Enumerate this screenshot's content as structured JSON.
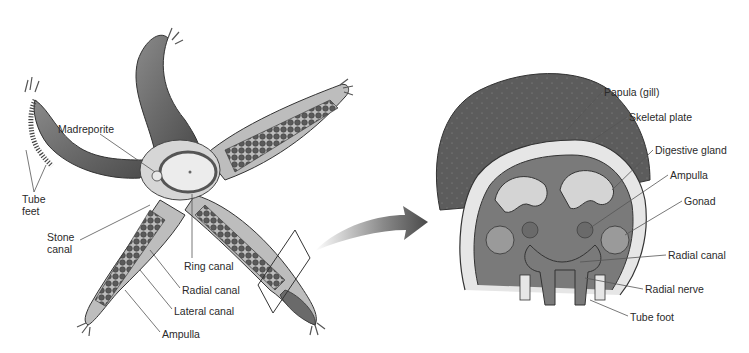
{
  "diagram": {
    "left_panel": {
      "name": "whole sea star",
      "labels": [
        {
          "id": "madreporite",
          "text": "Madreporite",
          "x": 58,
          "y": 123
        },
        {
          "id": "tube-feet",
          "text": "Tube\nfeet",
          "x": 22,
          "y": 193
        },
        {
          "id": "stone-canal",
          "text": "Stone\ncanal",
          "x": 47,
          "y": 231
        },
        {
          "id": "ring-canal",
          "text": "Ring canal",
          "x": 184,
          "y": 260
        },
        {
          "id": "radial-canal",
          "text": "Radial canal",
          "x": 182,
          "y": 284
        },
        {
          "id": "lateral-canal",
          "text": "Lateral canal",
          "x": 174,
          "y": 305
        },
        {
          "id": "ampulla",
          "text": "Ampulla",
          "x": 162,
          "y": 328
        }
      ]
    },
    "arrow": {
      "direction": "right",
      "color": "#555555"
    },
    "right_panel": {
      "name": "arm cross-section",
      "labels": [
        {
          "id": "papula",
          "text": "Papula (gill)",
          "x": 604,
          "y": 86
        },
        {
          "id": "skeletal-plate",
          "text": "Skeletal plate",
          "x": 629,
          "y": 111
        },
        {
          "id": "digestive-gland",
          "text": "Digestive gland",
          "x": 655,
          "y": 144
        },
        {
          "id": "ampulla-r",
          "text": "Ampulla",
          "x": 670,
          "y": 169
        },
        {
          "id": "gonad",
          "text": "Gonad",
          "x": 684,
          "y": 195
        },
        {
          "id": "radial-canal-r",
          "text": "Radial canal",
          "x": 668,
          "y": 249
        },
        {
          "id": "radial-nerve",
          "text": "Radial nerve",
          "x": 645,
          "y": 283
        },
        {
          "id": "tube-foot",
          "text": "Tube foot",
          "x": 630,
          "y": 311
        }
      ]
    },
    "colors": {
      "body": "#6e6e6e",
      "body_dark": "#4a4a4a",
      "arm_inner": "#c8c8c8",
      "plate": "#e6e6e6",
      "leader": "#555555",
      "text": "#2a2a2a"
    }
  }
}
